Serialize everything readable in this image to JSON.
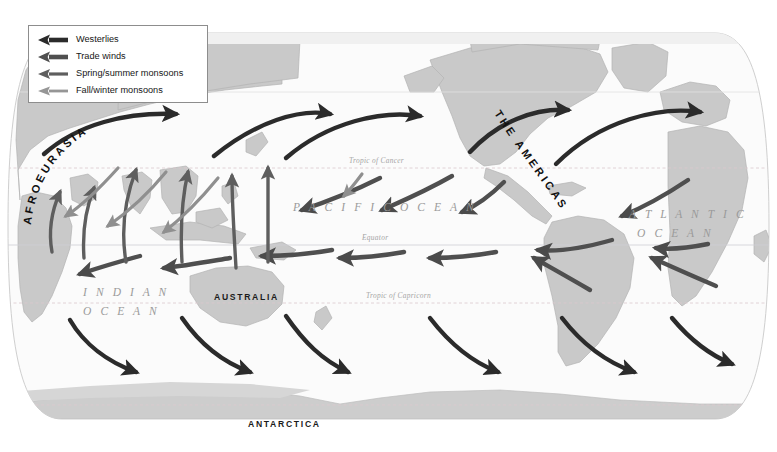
{
  "figure": {
    "kind": "world-wind-map",
    "projection_note": "oval world map"
  },
  "legend": {
    "items": [
      {
        "label": "Westerlies",
        "color": "#2b2b2b",
        "weight": "thick"
      },
      {
        "label": "Trade winds",
        "color": "#4b4b4b",
        "weight": "thick"
      },
      {
        "label": "Spring/summer monsoons",
        "color": "#5e5e5e",
        "weight": "medium"
      },
      {
        "label": "Fall/winter monsoons",
        "color": "#8f8f8f",
        "weight": "thin"
      }
    ]
  },
  "labels": {
    "oceans": [
      {
        "name": "PACIFIC OCEAN",
        "text": "P A C I F I C   O C E A N",
        "x": 293,
        "y": 208
      },
      {
        "name": "ATLANTIC",
        "text": "A T L A N T I C",
        "x": 629,
        "y": 215
      },
      {
        "name": "OCEAN",
        "text": "O C E A N",
        "x": 637,
        "y": 234
      },
      {
        "name": "INDIAN",
        "text": "I N D I A N",
        "x": 83,
        "y": 293
      },
      {
        "name": "OCEAN",
        "text": "O C E A N",
        "x": 83,
        "y": 312
      }
    ],
    "continents": [
      {
        "name": "AUSTRALIA",
        "text": "AUSTRALIA",
        "x": 214,
        "y": 297
      },
      {
        "name": "ANTARCTICA",
        "text": "ANTARCTICA",
        "x": 248,
        "y": 423
      }
    ],
    "curved": [
      {
        "name": "AFROEURASIA",
        "text": "AFROEURASIA"
      },
      {
        "name": "THE AMERICAS",
        "text": "THE AMERICAS"
      }
    ],
    "latitude_lines": [
      {
        "name": "Tropic of Cancer",
        "text": "Tropic of Cancer",
        "x": 349,
        "y": 161
      },
      {
        "name": "Equator",
        "text": "Equator",
        "x": 362,
        "y": 238
      },
      {
        "name": "Tropic of Capricorn",
        "text": "Tropic of Capricorn",
        "x": 366,
        "y": 296
      }
    ]
  },
  "colors": {
    "land": "#c9c9c9",
    "land_stroke": "#b0b0b0",
    "ocean": "#fbfbfb",
    "ice": "#d8d8d8",
    "graticule": "#d9c9cf",
    "westerlies": "#2b2b2b",
    "trade_winds": "#4b4b4b",
    "monsoon_summer": "#5e5e5e",
    "monsoon_winter": "#8f8f8f",
    "legend_border": "#8d8d8d"
  }
}
